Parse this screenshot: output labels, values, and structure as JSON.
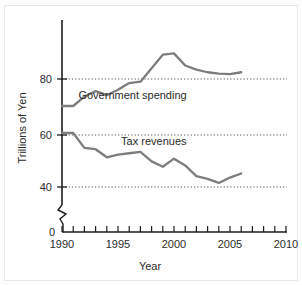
{
  "chart_data": {
    "type": "line",
    "title": "",
    "xlabel": "Year",
    "ylabel": "Trillions of Yen",
    "xlim": [
      1990,
      2010
    ],
    "ylim": [
      36,
      94
    ],
    "grid": true,
    "grid_values": [
      40,
      60,
      80
    ],
    "y_ticks": [
      0,
      40,
      60,
      80
    ],
    "y_tick_labels": [
      "0",
      "40",
      "60",
      "80"
    ],
    "y_axis_break": true,
    "x_ticks": [
      1990,
      1991,
      1992,
      1993,
      1994,
      1995,
      1996,
      1997,
      1998,
      1999,
      2000,
      2001,
      2002,
      2003,
      2004,
      2005,
      2006,
      2007,
      2008,
      2009,
      2010
    ],
    "x_tick_labels": [
      "1990",
      "1995",
      "2000",
      "2005",
      "2010"
    ],
    "x_labeled_ticks": [
      1990,
      1995,
      2000,
      2005,
      2010
    ],
    "legend_position": "inline-annotation",
    "line_color": "#7d7d7d",
    "axis_color": "#1c1c1c",
    "grid_color": "#555555",
    "x": [
      1990,
      1991,
      1992,
      1993,
      1994,
      1995,
      1996,
      1997,
      1998,
      1999,
      2000,
      2001,
      2002,
      2003,
      2004,
      2005,
      2006
    ],
    "series": [
      {
        "name": "Government spending",
        "values": [
          70,
          70,
          73.5,
          75.5,
          74,
          76,
          78.5,
          79,
          84,
          89,
          89.5,
          85,
          83.5,
          82.5,
          82,
          81.8,
          82.5
        ]
      },
      {
        "name": "Tax revenues",
        "values": [
          60,
          60,
          54.5,
          54,
          51,
          52,
          52.5,
          53,
          49.5,
          47.5,
          50.5,
          48,
          44,
          43,
          41.5,
          43.5,
          45
        ]
      }
    ],
    "annotations": [
      {
        "text": "Government spending",
        "x": 1996.3,
        "y": 72.5
      },
      {
        "text": "Tax revenues",
        "x": 1998.2,
        "y": 55.5
      }
    ]
  }
}
